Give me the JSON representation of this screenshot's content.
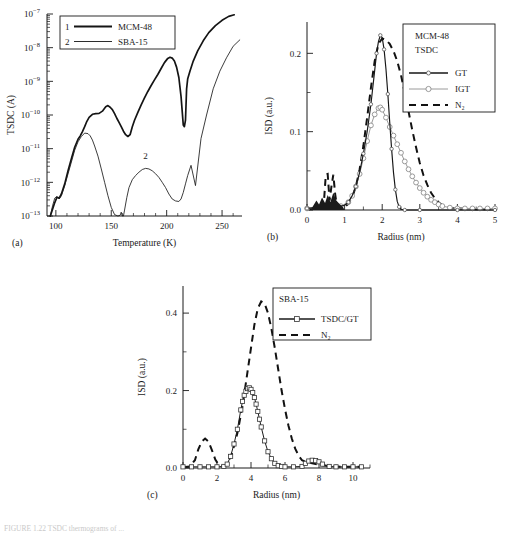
{
  "figure": {
    "panels": [
      "(a)",
      "(b)",
      "(c)"
    ],
    "caption": "FIGURE 1.22   TSDC thermograms of ..."
  },
  "panel_a": {
    "tag": "(a)",
    "ylabel": "TSDC (A)",
    "xlabel": "Temperature (K)",
    "xticks": [
      "100",
      "150",
      "200",
      "250"
    ],
    "yticks": [
      "10⁻¹³",
      "10⁻¹²",
      "10⁻¹¹",
      "10⁻¹⁰",
      "10⁻⁹",
      "10⁻⁸",
      "10⁻⁷"
    ],
    "legend": [
      {
        "num": "1",
        "label": "MCM-48"
      },
      {
        "num": "2",
        "label": "SBA-15"
      }
    ],
    "inline_labels": [
      "1",
      "2"
    ]
  },
  "panel_b": {
    "tag": "(b)",
    "ylabel": "ISD (a.u.)",
    "xlabel": "Radius (nm)",
    "xticks": [
      "0",
      "1",
      "2",
      "3",
      "4",
      "5"
    ],
    "yticks": [
      "0.0",
      "0.1",
      "0.2"
    ],
    "legend_title": [
      "MCM-48",
      "TSDC"
    ],
    "legend": [
      {
        "label": "GT",
        "style": "solid-circle",
        "color": "#161616"
      },
      {
        "label": "IGT",
        "style": "gray-circle",
        "color": "#9a9a9a"
      },
      {
        "label": "N₂",
        "style": "dashed",
        "color": "#121212"
      }
    ]
  },
  "panel_c": {
    "tag": "(c)",
    "ylabel": "ISD (a.u.)",
    "xlabel": "Radius (nm)",
    "xticks": [
      "0",
      "2",
      "4",
      "6",
      "8",
      "10"
    ],
    "yticks": [
      "0.0",
      "0.2",
      "0.4"
    ],
    "legend_title": [
      "SBA-15"
    ],
    "legend": [
      {
        "label": "TSDC/GT",
        "style": "solid-square",
        "color": "#1a1a1a"
      },
      {
        "label": "N₂",
        "style": "dashed",
        "color": "#121212"
      }
    ]
  },
  "chart_data": [
    {
      "type": "line",
      "id": "panel-a",
      "title": "",
      "xlabel": "Temperature (K)",
      "ylabel": "TSDC (A)",
      "yscale": "log",
      "xlim": [
        92,
        268
      ],
      "ylim": [
        1e-13,
        1e-07
      ],
      "grid": false,
      "legend_position": "top-left",
      "series": [
        {
          "name": "MCM-48",
          "marker_label": "1",
          "x": [
            95,
            97,
            99,
            101,
            103,
            105,
            108,
            111,
            114,
            117,
            120,
            122,
            124,
            126,
            128,
            130,
            133,
            136,
            139,
            142,
            145,
            147,
            149,
            151,
            153,
            155,
            157,
            159,
            161,
            163,
            165,
            167,
            169,
            171,
            174,
            177,
            180,
            183,
            186,
            189,
            192,
            195,
            198,
            201,
            203,
            205,
            207,
            209,
            211,
            213,
            215,
            216,
            217,
            218,
            219,
            221,
            224,
            228,
            233,
            238,
            244,
            250,
            256,
            261
          ],
          "y": [
            1e-13,
            1.6e-13,
            2.5e-13,
            3.6e-13,
            3.4e-13,
            4.5e-13,
            9e-13,
            2.2e-12,
            5e-12,
            1.1e-11,
            1.9e-11,
            2.4e-11,
            3.2e-11,
            4.5e-11,
            6.5e-11,
            8.5e-11,
            1.05e-10,
            1.1e-10,
            1.12e-10,
            1.3e-10,
            1.75e-10,
            1.9e-10,
            1.7e-10,
            1.45e-10,
            1.1e-10,
            8e-11,
            6e-11,
            4.5e-11,
            3.3e-11,
            2.6e-11,
            2.3e-11,
            2.6e-11,
            4.5e-11,
            7e-11,
            1.2e-10,
            2e-10,
            3.2e-10,
            5e-10,
            7.5e-10,
            1.1e-09,
            1.6e-09,
            2.4e-09,
            3.6e-09,
            4.8e-09,
            5.2e-09,
            4.9e-09,
            4e-09,
            2.6e-09,
            1.3e-09,
            3.5e-10,
            5e-11,
            4.5e-11,
            7e-11,
            6e-10,
            1.2e-09,
            2e-09,
            4e-09,
            8e-09,
            1.6e-08,
            2.8e-08,
            4.5e-08,
            6.5e-08,
            8.5e-08,
            9.5e-08
          ],
          "style": "thick-solid"
        },
        {
          "name": "SBA-15",
          "marker_label": "2",
          "x": [
            95,
            97,
            99,
            101,
            103,
            105,
            108,
            111,
            114,
            117,
            120,
            123,
            126,
            129,
            131,
            133,
            135,
            138,
            141,
            144,
            147,
            150,
            153,
            156,
            158,
            159,
            160,
            161,
            162,
            164,
            166,
            169,
            172,
            175,
            178,
            181,
            184,
            187,
            190,
            193,
            196,
            199,
            202,
            205,
            208,
            211,
            213,
            215,
            217,
            219,
            222,
            226,
            231,
            236,
            242,
            248,
            254,
            260,
            266
          ],
          "y": [
            1e-13,
            2e-13,
            3.4e-13,
            3.8e-13,
            3.2e-13,
            4e-13,
            8e-13,
            1.8e-12,
            4e-12,
            9e-12,
            1.6e-11,
            2.3e-11,
            2.9e-11,
            2.8e-11,
            2.4e-11,
            1.8e-11,
            1.2e-11,
            6e-12,
            2.5e-12,
            1e-12,
            4e-13,
            1.8e-13,
            1.1e-13,
            1e-13,
            1.05e-13,
            1.3e-13,
            1e-13,
            1e-13,
            1.5e-13,
            3.5e-13,
            7e-13,
            1.2e-12,
            1.6e-12,
            2e-12,
            2.4e-12,
            2.6e-12,
            2.5e-12,
            2.2e-12,
            1.8e-12,
            1.4e-12,
            1e-12,
            7e-13,
            4.5e-13,
            3.2e-13,
            2.8e-13,
            2.7e-13,
            3.2e-13,
            5e-13,
            9e-13,
            1.6e-12,
            3.2e-12,
            8e-13,
            2e-11,
            1e-10,
            6e-10,
            2e-09,
            5e-09,
            1.1e-08,
            1.7e-08
          ],
          "style": "thin-solid"
        }
      ]
    },
    {
      "type": "line",
      "id": "panel-b",
      "title": "MCM-48 TSDC",
      "xlabel": "Radius (nm)",
      "ylabel": "ISD (a.u.)",
      "xlim": [
        0,
        5
      ],
      "ylim": [
        0,
        0.24
      ],
      "grid": false,
      "legend_position": "top-right",
      "series": [
        {
          "name": "GT",
          "x": [
            0.0,
            0.2,
            0.4,
            0.6,
            0.8,
            1.0,
            1.1,
            1.2,
            1.3,
            1.4,
            1.5,
            1.6,
            1.7,
            1.8,
            1.85,
            1.9,
            1.95,
            2.0,
            2.05,
            2.1,
            2.15,
            2.2,
            2.25,
            2.3,
            2.35,
            2.4,
            2.45,
            2.5,
            2.6,
            2.8,
            3.0,
            3.5,
            4.0,
            4.5,
            5.0
          ],
          "y": [
            0.002,
            0.003,
            0.004,
            0.004,
            0.004,
            0.006,
            0.01,
            0.018,
            0.03,
            0.048,
            0.072,
            0.1,
            0.135,
            0.178,
            0.2,
            0.215,
            0.223,
            0.22,
            0.205,
            0.18,
            0.148,
            0.112,
            0.078,
            0.048,
            0.026,
            0.011,
            0.004,
            0.001,
            0.0,
            0.0,
            0.0,
            0.0,
            0.0,
            0.0,
            0.0
          ],
          "style": "solid-circle",
          "peak": {
            "x": 1.95,
            "y": 0.223
          }
        },
        {
          "name": "IGT",
          "x": [
            0.0,
            0.3,
            0.6,
            0.9,
            1.1,
            1.2,
            1.3,
            1.4,
            1.5,
            1.6,
            1.7,
            1.8,
            1.9,
            1.95,
            2.0,
            2.1,
            2.2,
            2.3,
            2.4,
            2.5,
            2.6,
            2.7,
            2.8,
            2.9,
            3.0,
            3.1,
            3.2,
            3.3,
            3.4,
            3.5,
            3.6,
            3.8,
            4.0,
            4.2,
            4.4,
            4.6,
            4.8,
            5.0
          ],
          "y": [
            0.002,
            0.003,
            0.004,
            0.005,
            0.01,
            0.018,
            0.03,
            0.046,
            0.066,
            0.088,
            0.108,
            0.122,
            0.13,
            0.131,
            0.128,
            0.118,
            0.106,
            0.095,
            0.084,
            0.073,
            0.062,
            0.052,
            0.043,
            0.035,
            0.028,
            0.022,
            0.017,
            0.013,
            0.01,
            0.007,
            0.005,
            0.003,
            0.002,
            0.002,
            0.002,
            0.002,
            0.002,
            0.002
          ],
          "style": "gray-circle",
          "peak": {
            "x": 1.95,
            "y": 0.131
          }
        },
        {
          "name": "N2",
          "x": [
            0.0,
            0.3,
            0.45,
            0.5,
            0.55,
            0.6,
            0.65,
            0.7,
            0.75,
            0.8,
            0.9,
            1.0,
            1.1,
            1.2,
            1.3,
            1.4,
            1.5,
            1.6,
            1.7,
            1.8,
            1.9,
            2.0,
            2.1,
            2.2,
            2.3,
            2.4,
            2.5,
            2.6,
            2.7,
            2.8,
            2.9,
            3.0,
            3.1,
            3.2,
            3.3,
            3.4,
            3.5,
            3.6,
            3.7,
            3.8,
            4.0,
            4.5,
            5.0
          ],
          "y": [
            0.001,
            0.002,
            0.01,
            0.045,
            0.046,
            0.012,
            0.03,
            0.045,
            0.02,
            0.004,
            0.003,
            0.004,
            0.008,
            0.016,
            0.03,
            0.052,
            0.082,
            0.118,
            0.156,
            0.19,
            0.212,
            0.219,
            0.217,
            0.212,
            0.203,
            0.19,
            0.172,
            0.15,
            0.126,
            0.102,
            0.08,
            0.06,
            0.044,
            0.032,
            0.022,
            0.015,
            0.01,
            0.006,
            0.004,
            0.003,
            0.002,
            0.001,
            0.001
          ],
          "style": "dashed",
          "peak": {
            "x": 2.05,
            "y": 0.219
          }
        }
      ]
    },
    {
      "type": "line",
      "id": "panel-c",
      "title": "SBA-15",
      "xlabel": "Radius (nm)",
      "ylabel": "ISD (a.u.)",
      "xlim": [
        0,
        11
      ],
      "ylim": [
        0,
        0.47
      ],
      "grid": false,
      "legend_position": "top-right",
      "series": [
        {
          "name": "TSDC/GT",
          "x": [
            0.0,
            0.5,
            1.0,
            1.5,
            2.0,
            2.4,
            2.6,
            2.8,
            3.0,
            3.2,
            3.4,
            3.5,
            3.6,
            3.7,
            3.8,
            3.9,
            4.0,
            4.1,
            4.2,
            4.3,
            4.4,
            4.5,
            4.6,
            4.8,
            5.0,
            5.2,
            5.4,
            5.6,
            5.8,
            6.0,
            6.5,
            7.0,
            7.2,
            7.4,
            7.6,
            7.8,
            8.0,
            8.2,
            8.6,
            9.0,
            9.5,
            10.0,
            10.5
          ],
          "y": [
            0.003,
            0.003,
            0.003,
            0.003,
            0.003,
            0.004,
            0.01,
            0.03,
            0.062,
            0.1,
            0.15,
            0.172,
            0.188,
            0.198,
            0.205,
            0.207,
            0.203,
            0.195,
            0.182,
            0.165,
            0.146,
            0.126,
            0.106,
            0.07,
            0.042,
            0.024,
            0.012,
            0.006,
            0.004,
            0.003,
            0.003,
            0.004,
            0.012,
            0.018,
            0.02,
            0.019,
            0.016,
            0.01,
            0.004,
            0.003,
            0.003,
            0.003,
            0.003
          ],
          "style": "solid-square",
          "peak": {
            "x": 3.9,
            "y": 0.207
          }
        },
        {
          "name": "N2",
          "x": [
            0.0,
            0.4,
            0.7,
            0.9,
            1.1,
            1.3,
            1.5,
            1.7,
            1.9,
            2.1,
            2.3,
            2.6,
            2.9,
            3.2,
            3.5,
            3.8,
            4.0,
            4.2,
            4.4,
            4.6,
            4.8,
            5.0,
            5.2,
            5.4,
            5.6,
            5.8,
            6.0,
            6.2,
            6.4,
            6.6,
            6.8,
            7.0,
            7.2,
            7.4,
            7.6,
            8.0,
            8.5,
            9.0,
            9.5,
            10.0,
            10.5
          ],
          "y": [
            0.002,
            0.004,
            0.02,
            0.048,
            0.068,
            0.076,
            0.068,
            0.046,
            0.022,
            0.008,
            0.004,
            0.01,
            0.04,
            0.09,
            0.16,
            0.25,
            0.31,
            0.37,
            0.412,
            0.43,
            0.425,
            0.4,
            0.36,
            0.31,
            0.255,
            0.2,
            0.152,
            0.11,
            0.076,
            0.05,
            0.032,
            0.02,
            0.016,
            0.014,
            0.012,
            0.008,
            0.005,
            0.004,
            0.003,
            0.003,
            0.003
          ],
          "style": "dashed",
          "peak": {
            "x": 4.65,
            "y": 0.43
          }
        }
      ]
    }
  ]
}
